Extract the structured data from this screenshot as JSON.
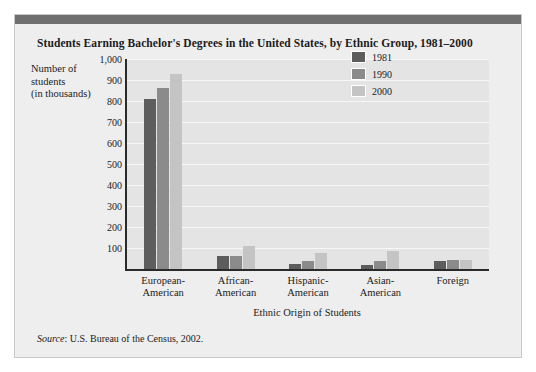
{
  "chart_data": {
    "type": "bar",
    "title": "Students Earning Bachelor's Degrees in the United States, by Ethnic Group, 1981–2000",
    "xlabel": "Ethnic Origin of Students",
    "ylabel": "Number of students (in thousands)",
    "ylabel_lines": [
      "Number of",
      "students",
      "(in thousands)"
    ],
    "categories": [
      "European-American",
      "African-American",
      "Hispanic-American",
      "Asian-American",
      "Foreign"
    ],
    "category_lines": [
      [
        "European-",
        "American"
      ],
      [
        "African-",
        "American"
      ],
      [
        "Hispanic-",
        "American"
      ],
      [
        "Asian-",
        "American"
      ],
      [
        "Foreign",
        ""
      ]
    ],
    "series": [
      {
        "name": "1981",
        "color": "#5d5d5d",
        "values": [
          810,
          60,
          22,
          18,
          40
        ]
      },
      {
        "name": "1990",
        "color": "#8b8b8b",
        "values": [
          860,
          62,
          37,
          38,
          42
        ]
      },
      {
        "name": "2000",
        "color": "#c4c4c4",
        "values": [
          930,
          110,
          75,
          85,
          45
        ]
      }
    ],
    "yticks": [
      "1,000",
      "900",
      "800",
      "700",
      "600",
      "500",
      "400",
      "300",
      "200",
      "100"
    ],
    "ytick_values": [
      1000,
      900,
      800,
      700,
      600,
      500,
      400,
      300,
      200,
      100
    ],
    "ylim": [
      0,
      1000
    ],
    "grid": true,
    "legend_position": "top-right",
    "source_prefix": "Source",
    "source_text": ": U.S. Bureau of the Census, 2002."
  }
}
